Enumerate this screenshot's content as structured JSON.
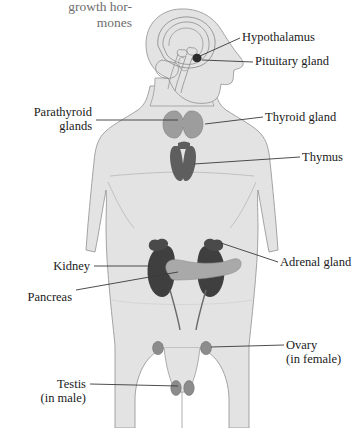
{
  "figure": {
    "corner_text": "growth hor-\nmones",
    "colors": {
      "background": "#ffffff",
      "body_fill": "#e3e3e3",
      "body_outline": "#9a9a9a",
      "brain_outline": "#8e8e8e",
      "leader_line": "#3a3a3a",
      "label_text": "#1a1a1a",
      "corner_text": "#6e6e6e",
      "thyroid": "#9d9d9d",
      "thymus": "#5e5e5e",
      "kidney": "#3f3f3f",
      "pancreas": "#a9a9a9",
      "adrenal": "#4a4a4a",
      "gonad": "#8c8c8c",
      "pituitary": "#2b2b2b"
    }
  },
  "labels": {
    "hypothalamus": "Hypothalamus",
    "pituitary": "Pituitary gland",
    "parathyroid": "Parathyroid\nglands",
    "thyroid": "Thyroid gland",
    "thymus": "Thymus",
    "kidney": "Kidney",
    "pancreas": "Pancreas",
    "adrenal": "Adrenal gland",
    "ovary": "Ovary\n(in female)",
    "testis": "Testis\n(in male)"
  }
}
